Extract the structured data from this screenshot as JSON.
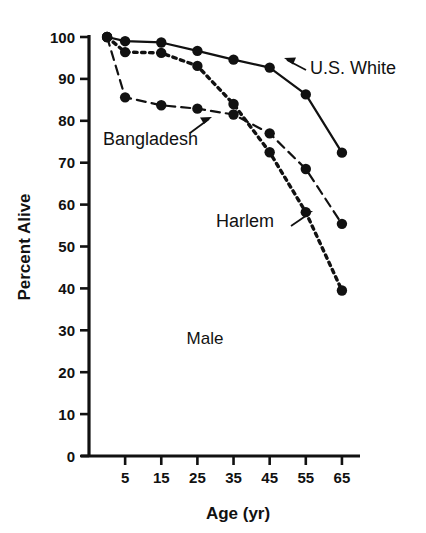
{
  "chart_data": {
    "type": "line",
    "title": "",
    "annotation": "Male",
    "xlabel": "Age (yr)",
    "ylabel": "Percent Alive",
    "x": [
      0,
      5,
      15,
      25,
      35,
      45,
      55,
      65
    ],
    "xticks": [
      5,
      15,
      25,
      35,
      45,
      55,
      65
    ],
    "xtick_labels": [
      "5",
      "15",
      "25",
      "35",
      "45",
      "55",
      "65"
    ],
    "xlim": [
      -5,
      70
    ],
    "yticks": [
      0,
      10,
      20,
      30,
      40,
      50,
      60,
      70,
      80,
      90,
      100
    ],
    "ytick_labels": [
      "0",
      "10",
      "20",
      "30",
      "40",
      "50",
      "60",
      "70",
      "80",
      "90",
      "100"
    ],
    "ylim": [
      0,
      100
    ],
    "grid": false,
    "legend_position": "inline-annotations",
    "series": [
      {
        "name": "U.S. White",
        "style": "solid",
        "label_x": 65,
        "values": [
          100,
          99.0,
          98.7,
          96.7,
          94.6,
          92.7,
          86.3,
          72.4
        ]
      },
      {
        "name": "Harlem",
        "style": "dotted",
        "values": [
          100,
          96.4,
          96.2,
          93.1,
          84.0,
          72.5,
          58.2,
          39.5
        ]
      },
      {
        "name": "Bangladesh",
        "style": "dashed",
        "values": [
          100,
          85.6,
          83.7,
          82.9,
          81.5,
          77.0,
          68.5,
          55.4
        ]
      }
    ]
  },
  "labels": {
    "us_white": "U.S. White",
    "harlem": "Harlem",
    "bangladesh": "Bangladesh",
    "male": "Male",
    "x_axis_title": "Age (yr)",
    "y_axis_title": "Percent Alive"
  },
  "colors": {
    "ink": "#111111",
    "background": "#ffffff"
  }
}
